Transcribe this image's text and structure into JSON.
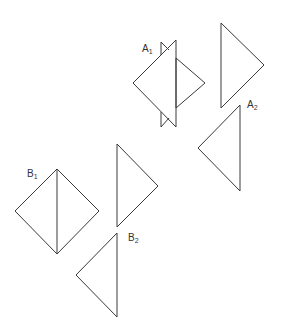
{
  "labels": {
    "a1": {
      "main": "A",
      "sub": "1"
    },
    "a2": {
      "main": "A",
      "sub": "2"
    },
    "b1": {
      "main": "B",
      "sub": "1"
    },
    "b2": {
      "main": "B",
      "sub": "2"
    }
  },
  "stroke_color": "#3a3a3a",
  "background_color": "#ffffff"
}
